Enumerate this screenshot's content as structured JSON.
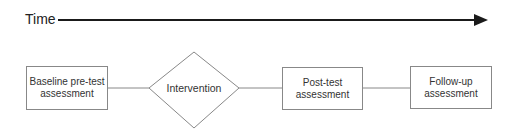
{
  "timeline": {
    "label": "Time",
    "arrow_color": "#1a1a1a"
  },
  "stages": [
    {
      "label": "Baseline pre-test assessment",
      "shape": "rectangle"
    },
    {
      "label": "Intervention",
      "shape": "diamond"
    },
    {
      "label": "Post-test assessment",
      "shape": "rectangle"
    },
    {
      "label": "Follow-up assessment",
      "shape": "rectangle"
    }
  ],
  "colors": {
    "stroke": "#888888",
    "text": "#333333",
    "background": "#ffffff"
  }
}
